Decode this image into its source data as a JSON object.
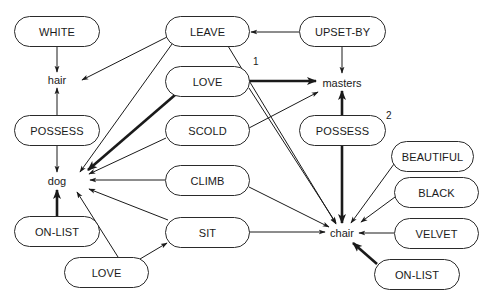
{
  "diagram": {
    "type": "conceptual-graph",
    "concepts": {
      "hair": "hair",
      "dog": "dog",
      "masters": "masters",
      "chair": "chair"
    },
    "relations": {
      "white": "WHITE",
      "possess_left": "POSSESS",
      "onlist_left": "ON-LIST",
      "love_bottom": "LOVE",
      "leave": "LEAVE",
      "love_mid": "LOVE",
      "scold": "SCOLD",
      "climb": "CLIMB",
      "sit": "SIT",
      "upset_by": "UPSET-BY",
      "possess_right": "POSSESS",
      "beautiful": "BEAUTIFUL",
      "black": "BLACK",
      "velvet": "VELVET",
      "onlist_right": "ON-LIST"
    },
    "annotations": {
      "love_mid_index": "1",
      "possess_right_index": "2"
    },
    "edges": [
      {
        "from": "WHITE",
        "to": "hair",
        "weight": "thin"
      },
      {
        "from": "POSSESS(left)",
        "to": "hair",
        "weight": "thin"
      },
      {
        "from": "POSSESS(left)",
        "to": "dog",
        "weight": "thin"
      },
      {
        "from": "ON-LIST(left)",
        "to": "dog",
        "weight": "bold"
      },
      {
        "from": "LEAVE",
        "to": "hair",
        "weight": "thin"
      },
      {
        "from": "LEAVE",
        "to": "dog",
        "weight": "thin"
      },
      {
        "from": "LEAVE",
        "to": "chair",
        "weight": "thin"
      },
      {
        "from": "UPSET-BY",
        "to": "LEAVE",
        "weight": "thin"
      },
      {
        "from": "UPSET-BY",
        "to": "masters",
        "weight": "thin"
      },
      {
        "from": "LOVE(mid)",
        "to": "dog",
        "weight": "bold"
      },
      {
        "from": "LOVE(mid)",
        "to": "masters",
        "weight": "bold"
      },
      {
        "from": "LOVE(mid)",
        "to": "chair",
        "weight": "thin"
      },
      {
        "from": "SCOLD",
        "to": "dog",
        "weight": "thin"
      },
      {
        "from": "SCOLD",
        "to": "masters",
        "weight": "thin"
      },
      {
        "from": "CLIMB",
        "to": "dog",
        "weight": "thin"
      },
      {
        "from": "CLIMB",
        "to": "chair",
        "weight": "thin"
      },
      {
        "from": "SIT",
        "to": "dog",
        "weight": "thin"
      },
      {
        "from": "SIT",
        "to": "chair",
        "weight": "thin"
      },
      {
        "from": "LOVE(bottom)",
        "to": "dog",
        "weight": "thin"
      },
      {
        "from": "LOVE(bottom)",
        "to": "SIT",
        "weight": "thin"
      },
      {
        "from": "POSSESS(right)",
        "to": "masters",
        "weight": "bold"
      },
      {
        "from": "POSSESS(right)",
        "to": "chair",
        "weight": "bold"
      },
      {
        "from": "BEAUTIFUL",
        "to": "chair",
        "weight": "thin"
      },
      {
        "from": "BLACK",
        "to": "chair",
        "weight": "thin"
      },
      {
        "from": "VELVET",
        "to": "chair",
        "weight": "thin"
      },
      {
        "from": "ON-LIST(right)",
        "to": "chair",
        "weight": "bold"
      }
    ]
  }
}
